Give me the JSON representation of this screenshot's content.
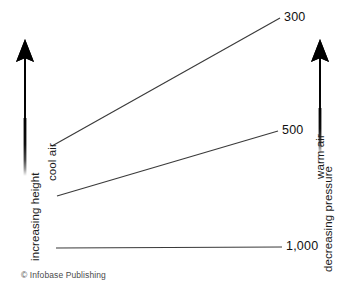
{
  "figure": {
    "title_visible": false,
    "credit": "© Infobase Publishing",
    "background_color": "#ffffff",
    "line_color": "#3a3a3a",
    "arrow_color": "#000000"
  },
  "axes": {
    "left": {
      "arrow_icon": "up-arrow-gradient-icon",
      "arrow_direction": "up",
      "label": "increasing height",
      "annotation": "cool air"
    },
    "right": {
      "arrow_icon": "up-arrow-gradient-icon",
      "arrow_direction": "up",
      "label": "decreasing pressure",
      "annotation": "warm air"
    }
  },
  "chart_data": {
    "type": "line",
    "title": "",
    "xlabel": "",
    "ylabel": "",
    "grid": false,
    "legend_position": "none",
    "series": [
      {
        "name": "300",
        "label": "300",
        "label_position": "right",
        "points": [
          [
            52,
            146
          ],
          [
            280,
            18
          ]
        ]
      },
      {
        "name": "500",
        "label": "500",
        "label_position": "right",
        "points": [
          [
            57,
            196
          ],
          [
            278,
            131
          ]
        ]
      },
      {
        "name": "1,000",
        "label": "1,000",
        "label_position": "right",
        "points": [
          [
            56,
            248
          ],
          [
            282,
            247
          ]
        ]
      }
    ],
    "value_labels": [
      "300",
      "500",
      "1,000"
    ],
    "units": "millibars"
  }
}
